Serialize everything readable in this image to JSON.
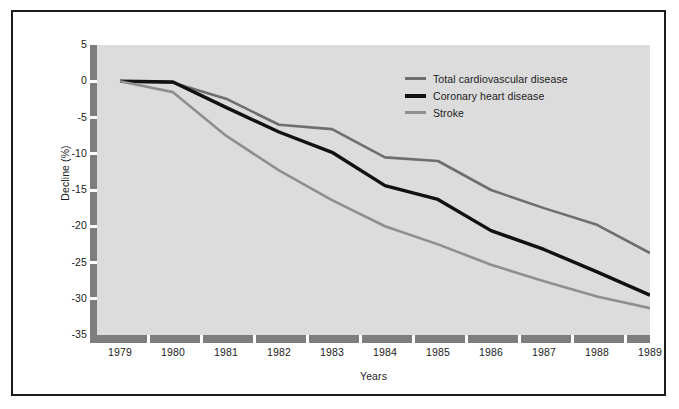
{
  "figure": {
    "background_color": "#ffffff",
    "border_color": "#1b1b1b",
    "plot_background_color": "#dcdcdc",
    "axis_bar_color": "#7d7d7d"
  },
  "axis": {
    "y_title": "Decline (%)",
    "x_title": "Years",
    "y_ticks": [
      "5",
      "0",
      "-5",
      "-10",
      "-15",
      "-20",
      "-25",
      "-30",
      "-35"
    ],
    "x_ticks": [
      "1979",
      "1980",
      "1981",
      "1982",
      "1983",
      "1984",
      "1985",
      "1986",
      "1987",
      "1988",
      "1989"
    ]
  },
  "legend": {
    "items": [
      {
        "label": "Total cardiovascular disease",
        "color": "#6e6e6e"
      },
      {
        "label": "Coronary heart disease",
        "color": "#111111"
      },
      {
        "label": "Stroke",
        "color": "#8f8f8f"
      }
    ]
  },
  "chart_data": {
    "type": "line",
    "title": "",
    "subtitle": "",
    "xlabel": "Years",
    "ylabel": "Decline (%)",
    "xlim": [
      1979,
      1989
    ],
    "ylim": [
      -35,
      5
    ],
    "grid": false,
    "legend_position": "inside-top-right",
    "x": [
      1979,
      1980,
      1981,
      1982,
      1983,
      1984,
      1985,
      1986,
      1987,
      1988,
      1989
    ],
    "series": [
      {
        "name": "Total cardiovascular disease",
        "color": "#6e6e6e",
        "line_width": 2.6,
        "values": [
          0,
          -0.2,
          -2.4,
          -6.0,
          -6.6,
          -10.5,
          -11.0,
          -15.0,
          -17.5,
          -19.8,
          -23.7
        ]
      },
      {
        "name": "Coronary heart disease",
        "color": "#111111",
        "line_width": 3.4,
        "values": [
          0,
          -0.1,
          -3.6,
          -7.0,
          -9.8,
          -14.4,
          -16.3,
          -20.6,
          -23.2,
          -26.3,
          -29.5
        ]
      },
      {
        "name": "Stroke",
        "color": "#8f8f8f",
        "line_width": 2.6,
        "values": [
          0,
          -1.5,
          -7.5,
          -12.3,
          -16.4,
          -20.0,
          -22.5,
          -25.3,
          -27.6,
          -29.7,
          -31.3
        ]
      }
    ]
  }
}
